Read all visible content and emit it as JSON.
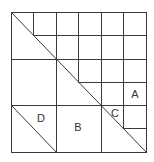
{
  "figure": {
    "type": "square grid dissection",
    "grid": {
      "columns": 6,
      "rows": 6
    },
    "colors": {
      "background": "#ffffff",
      "line": "#3a3a3a",
      "label": "#333333"
    },
    "labels": [
      {
        "id": "A",
        "text": "A"
      },
      {
        "id": "B",
        "text": "B"
      },
      {
        "id": "C",
        "text": "C"
      },
      {
        "id": "D",
        "text": "D"
      }
    ]
  }
}
